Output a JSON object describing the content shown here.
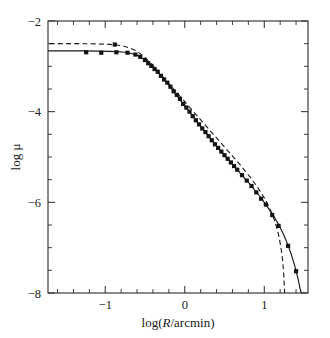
{
  "chart_data": {
    "type": "line",
    "title": "",
    "xlabel": "log(R/arcmin)",
    "ylabel": "log μ",
    "xlim": [
      -1.72,
      1.55
    ],
    "ylim": [
      -8,
      -2
    ],
    "grid": false,
    "legend": "none",
    "xticks_major": [
      -1,
      0,
      1
    ],
    "xtick_labels": [
      "-1",
      "0",
      "1"
    ],
    "xticks_minor": [
      -1.6,
      -1.4,
      -1.2,
      -0.8,
      -0.6,
      -0.4,
      -0.2,
      0.2,
      0.4,
      0.6,
      0.8,
      1.2,
      1.4
    ],
    "yticks_major": [
      -2,
      -4,
      -6,
      -8
    ],
    "ytick_labels": [
      "-2",
      "-4",
      "-6",
      "-8"
    ],
    "yticks_minor": [
      -2.5,
      -3,
      -3.5,
      -4.5,
      -5,
      -5.5,
      -6.5,
      -7,
      -7.5
    ],
    "series": [
      {
        "name": "solid-model",
        "style": "solid",
        "points": [
          [
            -1.72,
            -2.66
          ],
          [
            -1.55,
            -2.66
          ],
          [
            -1.4,
            -2.66
          ],
          [
            -1.25,
            -2.66
          ],
          [
            -1.1,
            -2.665
          ],
          [
            -0.95,
            -2.67
          ],
          [
            -0.85,
            -2.675
          ],
          [
            -0.75,
            -2.69
          ],
          [
            -0.68,
            -2.71
          ],
          [
            -0.62,
            -2.74
          ],
          [
            -0.56,
            -2.79
          ],
          [
            -0.5,
            -2.86
          ],
          [
            -0.44,
            -2.95
          ],
          [
            -0.38,
            -3.05
          ],
          [
            -0.32,
            -3.17
          ],
          [
            -0.26,
            -3.29
          ],
          [
            -0.2,
            -3.42
          ],
          [
            -0.14,
            -3.55
          ],
          [
            -0.08,
            -3.69
          ],
          [
            -0.02,
            -3.83
          ],
          [
            0.04,
            -3.96
          ],
          [
            0.1,
            -4.1
          ],
          [
            0.16,
            -4.24
          ],
          [
            0.22,
            -4.37
          ],
          [
            0.28,
            -4.5
          ],
          [
            0.34,
            -4.63
          ],
          [
            0.4,
            -4.76
          ],
          [
            0.46,
            -4.88
          ],
          [
            0.52,
            -5.0
          ],
          [
            0.58,
            -5.12
          ],
          [
            0.64,
            -5.24
          ],
          [
            0.7,
            -5.36
          ],
          [
            0.76,
            -5.48
          ],
          [
            0.82,
            -5.6
          ],
          [
            0.88,
            -5.73
          ],
          [
            0.94,
            -5.86
          ],
          [
            1.0,
            -6.0
          ],
          [
            1.06,
            -6.15
          ],
          [
            1.12,
            -6.31
          ],
          [
            1.18,
            -6.49
          ],
          [
            1.24,
            -6.7
          ],
          [
            1.3,
            -6.95
          ],
          [
            1.34,
            -7.15
          ],
          [
            1.38,
            -7.38
          ],
          [
            1.42,
            -7.65
          ],
          [
            1.45,
            -7.9
          ],
          [
            1.465,
            -8.0
          ]
        ]
      },
      {
        "name": "dashed-model",
        "style": "dashed",
        "points": [
          [
            -1.7,
            -2.5
          ],
          [
            -1.5,
            -2.5
          ],
          [
            -1.3,
            -2.5
          ],
          [
            -1.1,
            -2.505
          ],
          [
            -0.95,
            -2.515
          ],
          [
            -0.85,
            -2.53
          ],
          [
            -0.78,
            -2.55
          ],
          [
            -0.7,
            -2.59
          ],
          [
            -0.62,
            -2.65
          ],
          [
            -0.56,
            -2.72
          ],
          [
            -0.5,
            -2.81
          ],
          [
            -0.44,
            -2.91
          ],
          [
            -0.38,
            -3.02
          ],
          [
            -0.32,
            -3.14
          ],
          [
            -0.26,
            -3.26
          ],
          [
            -0.2,
            -3.38
          ],
          [
            -0.14,
            -3.5
          ],
          [
            -0.08,
            -3.62
          ],
          [
            -0.02,
            -3.74
          ],
          [
            0.04,
            -3.86
          ],
          [
            0.1,
            -3.98
          ],
          [
            0.16,
            -4.1
          ],
          [
            0.22,
            -4.22
          ],
          [
            0.28,
            -4.34
          ],
          [
            0.34,
            -4.46
          ],
          [
            0.4,
            -4.58
          ],
          [
            0.46,
            -4.7
          ],
          [
            0.52,
            -4.82
          ],
          [
            0.58,
            -4.94
          ],
          [
            0.64,
            -5.06
          ],
          [
            0.7,
            -5.18
          ],
          [
            0.76,
            -5.31
          ],
          [
            0.82,
            -5.44
          ],
          [
            0.88,
            -5.58
          ],
          [
            0.94,
            -5.73
          ],
          [
            1.0,
            -5.9
          ],
          [
            1.04,
            -6.03
          ],
          [
            1.08,
            -6.18
          ],
          [
            1.12,
            -6.36
          ],
          [
            1.15,
            -6.52
          ],
          [
            1.18,
            -6.72
          ],
          [
            1.2,
            -6.9
          ],
          [
            1.22,
            -7.12
          ],
          [
            1.235,
            -7.35
          ],
          [
            1.245,
            -7.6
          ],
          [
            1.252,
            -7.85
          ],
          [
            1.256,
            -8.0
          ]
        ]
      }
    ],
    "scatter": {
      "name": "observed-data",
      "marker": "filled-square",
      "points": [
        [
          -1.24,
          -2.69
        ],
        [
          -1.05,
          -2.7
        ],
        [
          -0.88,
          -2.52
        ],
        [
          -0.86,
          -2.69
        ],
        [
          -0.72,
          -2.7
        ],
        [
          -0.62,
          -2.74
        ],
        [
          -0.56,
          -2.79
        ],
        [
          -0.5,
          -2.86
        ],
        [
          -0.46,
          -2.93
        ],
        [
          -0.42,
          -2.99
        ],
        [
          -0.38,
          -3.06
        ],
        [
          -0.34,
          -3.12
        ],
        [
          -0.3,
          -3.21
        ],
        [
          -0.26,
          -3.29
        ],
        [
          -0.22,
          -3.36
        ],
        [
          -0.18,
          -3.45
        ],
        [
          -0.14,
          -3.55
        ],
        [
          -0.1,
          -3.63
        ],
        [
          -0.06,
          -3.72
        ],
        [
          -0.02,
          -3.83
        ],
        [
          0.02,
          -3.91
        ],
        [
          0.06,
          -4.0
        ],
        [
          0.1,
          -4.1
        ],
        [
          0.14,
          -4.19
        ],
        [
          0.18,
          -4.28
        ],
        [
          0.22,
          -4.37
        ],
        [
          0.26,
          -4.45
        ],
        [
          0.3,
          -4.54
        ],
        [
          0.34,
          -4.63
        ],
        [
          0.38,
          -4.72
        ],
        [
          0.42,
          -4.8
        ],
        [
          0.46,
          -4.88
        ],
        [
          0.5,
          -4.96
        ],
        [
          0.54,
          -5.04
        ],
        [
          0.58,
          -5.12
        ],
        [
          0.62,
          -5.2
        ],
        [
          0.66,
          -5.28
        ],
        [
          0.72,
          -5.4
        ],
        [
          0.78,
          -5.52
        ],
        [
          0.84,
          -5.64
        ],
        [
          0.9,
          -5.78
        ],
        [
          0.96,
          -5.92
        ],
        [
          1.02,
          -6.05
        ],
        [
          1.1,
          -6.28
        ],
        [
          1.18,
          -6.52
        ],
        [
          1.3,
          -6.96
        ],
        [
          1.4,
          -7.52
        ]
      ]
    }
  }
}
